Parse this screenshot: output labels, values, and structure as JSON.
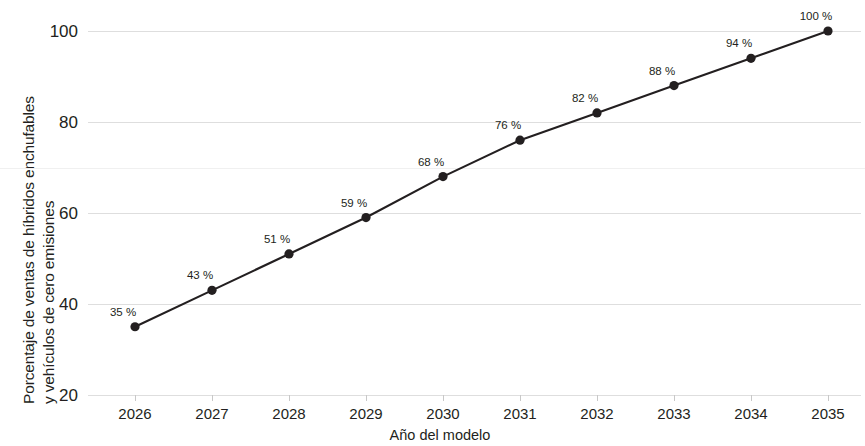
{
  "chart_data": {
    "type": "line",
    "title": "",
    "xlabel": "Año del modelo",
    "ylabel": "Porcentaje de ventas de híbridos enchufables y vehículos de cero emisiones",
    "ylabel_line1": "Porcentaje de ventas de híbridos enchufables",
    "ylabel_line2": "y vehículos de cero emisiones",
    "categories": [
      "2026",
      "2027",
      "2028",
      "2029",
      "2030",
      "2031",
      "2032",
      "2033",
      "2034",
      "2035"
    ],
    "values": [
      35,
      43,
      51,
      59,
      68,
      76,
      82,
      88,
      94,
      100
    ],
    "point_labels": [
      "35 %",
      "43 %",
      "51 %",
      "59 %",
      "68 %",
      "76 %",
      "82 %",
      "88 %",
      "94 %",
      "100 %"
    ],
    "ylim": [
      20,
      100
    ],
    "yticks": [
      20,
      40,
      60,
      80,
      100
    ],
    "ytick_labels": [
      "20",
      "40",
      "60",
      "80",
      "100"
    ],
    "xlim": [
      "2026",
      "2035"
    ],
    "grid": true,
    "grid_axis": "y",
    "legend": null,
    "legend_position": "none",
    "colors": {
      "line": "#231f20",
      "marker": "#231f20",
      "grid": "#dedede",
      "text": "#231f20",
      "background": "#ffffff"
    }
  }
}
